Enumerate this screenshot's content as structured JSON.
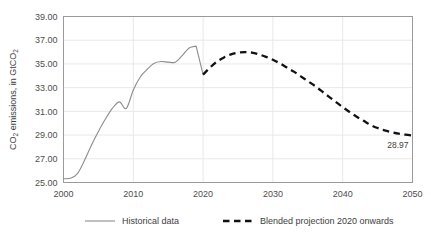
{
  "chart_data": {
    "type": "line",
    "title": "",
    "xlabel": "",
    "ylabel": "CO2 emissions, in GtCO2",
    "ylabel_parts": {
      "prefix": "CO",
      "sub1": "2",
      "middle": " emissions, in GtCO",
      "sub2": "2"
    },
    "xlim": [
      2000,
      2050
    ],
    "ylim": [
      25.0,
      39.0
    ],
    "y_tick_step": 2.0,
    "grid": "horizontal-and-vertical-light",
    "legend_position": "bottom",
    "x_ticks": [
      "2000",
      "2010",
      "2020",
      "2030",
      "2040",
      "2050"
    ],
    "x_tick_values": [
      2000,
      2010,
      2020,
      2030,
      2040,
      2050
    ],
    "y_ticks": [
      "25.00",
      "27.00",
      "29.00",
      "31.00",
      "33.00",
      "35.00",
      "37.00",
      "39.00"
    ],
    "y_tick_values": [
      25.0,
      27.0,
      29.0,
      31.0,
      33.0,
      35.0,
      37.0,
      39.0
    ],
    "annotations": [
      {
        "text": "28.97",
        "x": 2050,
        "y": 28.97
      }
    ],
    "series": [
      {
        "name": "Historical data",
        "style": "solid",
        "color": "#8c8c8c",
        "x": [
          2000,
          2001,
          2002,
          2003,
          2004,
          2005,
          2006,
          2007,
          2008,
          2009,
          2010,
          2011,
          2012,
          2013,
          2014,
          2015,
          2016,
          2017,
          2018,
          2019,
          2020
        ],
        "values": [
          25.32,
          25.35,
          25.75,
          26.85,
          28.15,
          29.3,
          30.35,
          31.25,
          31.8,
          31.25,
          32.8,
          33.9,
          34.55,
          35.05,
          35.2,
          35.15,
          35.15,
          35.7,
          36.35,
          36.5,
          34.1
        ]
      },
      {
        "name": "Blended projection 2020 onwards",
        "style": "dashed",
        "color": "#111111",
        "x": [
          2020,
          2021,
          2022,
          2023,
          2024,
          2025,
          2026,
          2027,
          2028,
          2029,
          2030,
          2031,
          2032,
          2033,
          2034,
          2035,
          2036,
          2037,
          2038,
          2039,
          2040,
          2041,
          2042,
          2043,
          2044,
          2045,
          2046,
          2047,
          2048,
          2049,
          2050
        ],
        "values": [
          34.1,
          34.7,
          35.2,
          35.55,
          35.8,
          35.95,
          36.0,
          35.95,
          35.8,
          35.6,
          35.35,
          35.05,
          34.7,
          34.35,
          33.95,
          33.55,
          33.15,
          32.7,
          32.25,
          31.8,
          31.35,
          30.95,
          30.55,
          30.2,
          29.85,
          29.6,
          29.4,
          29.25,
          29.12,
          29.03,
          28.97
        ]
      }
    ]
  },
  "legend": {
    "items": [
      {
        "label": "Historical data",
        "style": "solid",
        "color": "#8c8c8c"
      },
      {
        "label": "Blended projection 2020 onwards",
        "style": "dashed",
        "color": "#111111"
      }
    ]
  }
}
